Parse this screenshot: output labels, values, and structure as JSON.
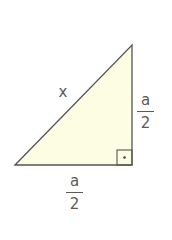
{
  "diagram": {
    "type": "right-triangle",
    "fill_color": "#fdfde4",
    "stroke_color": "#555555",
    "labels": {
      "hypotenuse": "x",
      "vertical_leg": {
        "numerator": "a",
        "denominator": "2"
      },
      "horizontal_leg": {
        "numerator": "a",
        "denominator": "2"
      }
    },
    "right_angle_marker": "square-with-dot"
  }
}
